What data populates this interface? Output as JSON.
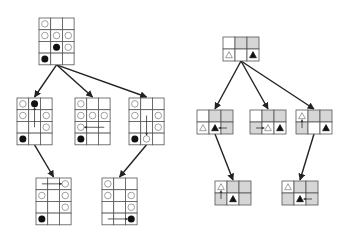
{
  "colors": {
    "line": "#555555",
    "edge": "#222222",
    "shade": "#d6d6d6",
    "piece_dark": "#111111",
    "piece_light_stroke": "#888888"
  },
  "left_tree": {
    "cell": 11.7,
    "nodes": [
      {
        "id": "L0",
        "x": 39,
        "y": 18,
        "cols": 3,
        "rows": 4,
        "cells": [
          [
            "o",
            "",
            ""
          ],
          [
            "o",
            "o",
            "o"
          ],
          [
            "",
            "b",
            "o"
          ],
          [
            "b",
            "",
            ""
          ]
        ]
      },
      {
        "id": "L1",
        "x": 17,
        "y": 98,
        "cols": 3,
        "rows": 4,
        "cells": [
          [
            "o",
            "b",
            ""
          ],
          [
            "o",
            "",
            "o"
          ],
          [
            "",
            "",
            "o"
          ],
          [
            "b",
            "",
            ""
          ]
        ],
        "arrow": {
          "from": [
            2,
            1
          ],
          "to": [
            0,
            1
          ]
        }
      },
      {
        "id": "L2",
        "x": 75,
        "y": 98,
        "cols": 3,
        "rows": 4,
        "cells": [
          [
            "o",
            "",
            ""
          ],
          [
            "o",
            "o",
            "o"
          ],
          [
            "o",
            "",
            ""
          ],
          [
            "b",
            "",
            ""
          ]
        ],
        "arrow": {
          "from": [
            2,
            2
          ],
          "to": [
            2,
            0
          ]
        }
      },
      {
        "id": "L3",
        "x": 129,
        "y": 98,
        "cols": 3,
        "rows": 4,
        "cells": [
          [
            "o",
            "",
            ""
          ],
          [
            "o",
            "",
            "o"
          ],
          [
            "",
            "",
            "o"
          ],
          [
            "b",
            "o",
            ""
          ]
        ],
        "arrow": {
          "from": [
            1,
            1
          ],
          "to": [
            3,
            1
          ]
        }
      },
      {
        "id": "L4",
        "x": 36,
        "y": 178,
        "cols": 3,
        "rows": 4,
        "cells": [
          [
            "",
            "",
            "o"
          ],
          [
            "o",
            "",
            "o"
          ],
          [
            "",
            "",
            "o"
          ],
          [
            "b",
            "",
            ""
          ]
        ],
        "arrow": {
          "from": [
            0,
            0
          ],
          "to": [
            0,
            2
          ]
        }
      },
      {
        "id": "L5",
        "x": 102,
        "y": 178,
        "cols": 3,
        "rows": 4,
        "cells": [
          [
            "o",
            "",
            ""
          ],
          [
            "o",
            "",
            "o"
          ],
          [
            "",
            "",
            "o"
          ],
          [
            "",
            "",
            "b"
          ]
        ],
        "arrow": {
          "from": [
            3,
            0
          ],
          "to": [
            3,
            2
          ]
        }
      }
    ],
    "edges": [
      [
        "L0",
        "L1"
      ],
      [
        "L0",
        "L2"
      ],
      [
        "L0",
        "L3"
      ],
      [
        "L1",
        "L4"
      ],
      [
        "L3",
        "L5"
      ]
    ]
  },
  "right_tree": {
    "cell": 12,
    "nodes": [
      {
        "id": "R0",
        "x": 223,
        "y": 37,
        "cols": 3,
        "rows": 2,
        "shade": [
          [
            0,
            1,
            1
          ],
          [
            0,
            0,
            0
          ]
        ],
        "cells": [
          [
            "",
            "",
            ""
          ],
          [
            "t",
            "",
            "T"
          ]
        ]
      },
      {
        "id": "R1",
        "x": 197,
        "y": 110,
        "cols": 3,
        "rows": 2,
        "shade": [
          [
            0,
            1,
            1
          ],
          [
            0,
            0,
            1
          ]
        ],
        "cells": [
          [
            "",
            "",
            ""
          ],
          [
            "t",
            "T",
            ""
          ]
        ],
        "arrow": {
          "from": [
            1,
            2
          ],
          "to": [
            1,
            1
          ]
        }
      },
      {
        "id": "R2",
        "x": 250,
        "y": 110,
        "cols": 3,
        "rows": 2,
        "shade": [
          [
            0,
            1,
            1
          ],
          [
            1,
            0,
            0
          ]
        ],
        "cells": [
          [
            "",
            "",
            ""
          ],
          [
            "",
            "t",
            "T"
          ]
        ],
        "arrow": {
          "from": [
            1,
            0
          ],
          "to": [
            1,
            1
          ]
        }
      },
      {
        "id": "R3",
        "x": 296,
        "y": 110,
        "cols": 3,
        "rows": 2,
        "shade": [
          [
            0,
            1,
            1
          ],
          [
            1,
            0,
            0
          ]
        ],
        "cells": [
          [
            "t",
            "",
            ""
          ],
          [
            "",
            "",
            "T"
          ]
        ],
        "arrow": {
          "from": [
            1,
            0
          ],
          "to": [
            0,
            0
          ]
        }
      },
      {
        "id": "R4",
        "x": 215,
        "y": 181,
        "cols": 3,
        "rows": 2,
        "shade": [
          [
            0,
            1,
            1
          ],
          [
            1,
            0,
            1
          ]
        ],
        "cells": [
          [
            "t",
            "",
            ""
          ],
          [
            "",
            "T",
            ""
          ]
        ],
        "arrow": {
          "from": [
            1,
            0
          ],
          "to": [
            0,
            0
          ]
        }
      },
      {
        "id": "R5",
        "x": 282,
        "y": 181,
        "cols": 3,
        "rows": 2,
        "shade": [
          [
            0,
            1,
            1
          ],
          [
            1,
            0,
            1
          ]
        ],
        "cells": [
          [
            "t",
            "",
            ""
          ],
          [
            "",
            "T",
            ""
          ]
        ],
        "arrow": {
          "from": [
            1,
            2
          ],
          "to": [
            1,
            1
          ]
        }
      }
    ],
    "edges": [
      [
        "R0",
        "R1"
      ],
      [
        "R0",
        "R2"
      ],
      [
        "R0",
        "R3"
      ],
      [
        "R1",
        "R4"
      ],
      [
        "R3",
        "R5"
      ]
    ]
  },
  "legend": {
    "o": "hollow-circle",
    "b": "filled-circle",
    "t": "hollow-triangle",
    "T": "filled-triangle"
  }
}
